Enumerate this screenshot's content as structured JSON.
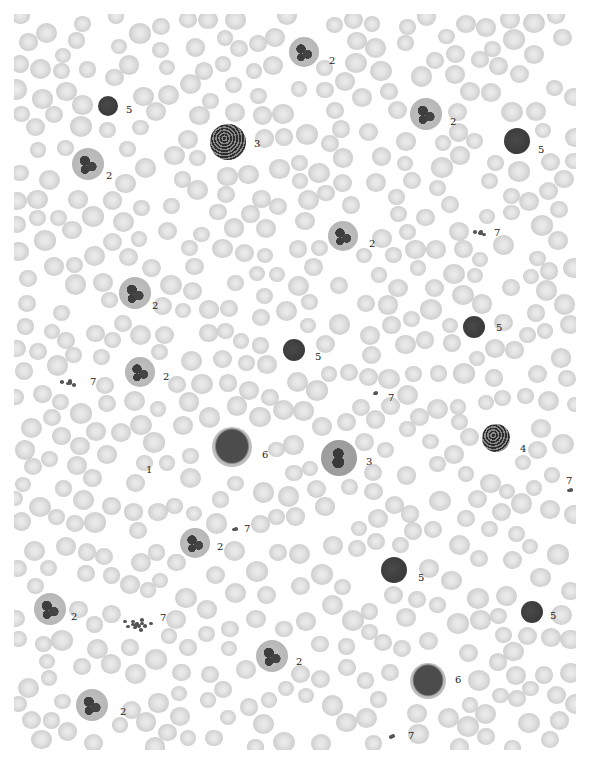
{
  "figure": {
    "background": "#ffffff",
    "rbc_color": "#d2d2d2"
  },
  "annotations": [
    {
      "label": "5",
      "x": 126,
      "y": 110,
      "cell": {
        "x": 108,
        "y": 106,
        "r": 10,
        "type": "lymphocyte"
      }
    },
    {
      "label": "3",
      "x": 254,
      "y": 144,
      "cell": {
        "x": 228,
        "y": 142,
        "r": 18,
        "type": "basophil-granular"
      }
    },
    {
      "label": "2",
      "x": 106,
      "y": 176,
      "cell": {
        "x": 88,
        "y": 164,
        "r": 16,
        "type": "neutrophil"
      }
    },
    {
      "label": "2",
      "x": 329,
      "y": 61,
      "cell": {
        "x": 304,
        "y": 52,
        "r": 15,
        "type": "neutrophil"
      }
    },
    {
      "label": "2",
      "x": 450,
      "y": 122,
      "cell": {
        "x": 426,
        "y": 114,
        "r": 16,
        "type": "neutrophil"
      }
    },
    {
      "label": "5",
      "x": 538,
      "y": 150,
      "cell": {
        "x": 517,
        "y": 141,
        "r": 13,
        "type": "lymphocyte"
      }
    },
    {
      "label": "2",
      "x": 369,
      "y": 244,
      "cell": {
        "x": 343,
        "y": 236,
        "r": 15,
        "type": "neutrophil"
      }
    },
    {
      "label": "7",
      "x": 494,
      "y": 233,
      "cell": {
        "x": 481,
        "y": 233,
        "r": 6,
        "type": "platelets"
      }
    },
    {
      "label": "2",
      "x": 152,
      "y": 306,
      "cell": {
        "x": 135,
        "y": 293,
        "r": 16,
        "type": "neutrophil"
      }
    },
    {
      "label": "5",
      "x": 496,
      "y": 328,
      "cell": {
        "x": 474,
        "y": 327,
        "r": 11,
        "type": "lymphocyte"
      }
    },
    {
      "label": "5",
      "x": 315,
      "y": 357,
      "cell": {
        "x": 294,
        "y": 350,
        "r": 11,
        "type": "lymphocyte"
      }
    },
    {
      "label": "2",
      "x": 163,
      "y": 377,
      "cell": {
        "x": 140,
        "y": 372,
        "r": 15,
        "type": "neutrophil"
      }
    },
    {
      "label": "7",
      "x": 90,
      "y": 382,
      "cell": {
        "x": 70,
        "y": 383,
        "r": 8,
        "type": "platelets"
      }
    },
    {
      "label": "7",
      "x": 388,
      "y": 398,
      "cell": {
        "x": 376,
        "y": 393,
        "r": 3,
        "type": "platelets"
      }
    },
    {
      "label": "6",
      "x": 262,
      "y": 455,
      "cell": {
        "x": 232,
        "y": 447,
        "r": 20,
        "type": "monocyte"
      }
    },
    {
      "label": "3",
      "x": 366,
      "y": 462,
      "cell": {
        "x": 339,
        "y": 458,
        "r": 18,
        "type": "eosinophil"
      }
    },
    {
      "label": "4",
      "x": 520,
      "y": 449,
      "cell": {
        "x": 496,
        "y": 438,
        "r": 14,
        "type": "basophil"
      }
    },
    {
      "label": "1",
      "x": 146,
      "y": 470,
      "cell": null
    },
    {
      "label": "7",
      "x": 566,
      "y": 481,
      "cell": {
        "x": 571,
        "y": 490,
        "r": 4,
        "type": "platelets"
      }
    },
    {
      "label": "7",
      "x": 244,
      "y": 529,
      "cell": {
        "x": 236,
        "y": 529,
        "r": 4,
        "type": "platelets"
      }
    },
    {
      "label": "2",
      "x": 217,
      "y": 547,
      "cell": {
        "x": 195,
        "y": 543,
        "r": 15,
        "type": "neutrophil"
      }
    },
    {
      "label": "5",
      "x": 418,
      "y": 578,
      "cell": {
        "x": 394,
        "y": 570,
        "r": 13,
        "type": "lymphocyte"
      }
    },
    {
      "label": "2",
      "x": 71,
      "y": 617,
      "cell": {
        "x": 50,
        "y": 609,
        "r": 16,
        "type": "neutrophil"
      }
    },
    {
      "label": "7",
      "x": 160,
      "y": 618,
      "cell": {
        "x": 137,
        "y": 625,
        "r": 12,
        "type": "platelets"
      }
    },
    {
      "label": "5",
      "x": 550,
      "y": 616,
      "cell": {
        "x": 532,
        "y": 612,
        "r": 11,
        "type": "lymphocyte"
      }
    },
    {
      "label": "2",
      "x": 296,
      "y": 662,
      "cell": {
        "x": 272,
        "y": 656,
        "r": 16,
        "type": "neutrophil"
      }
    },
    {
      "label": "6",
      "x": 455,
      "y": 680,
      "cell": {
        "x": 428,
        "y": 681,
        "r": 18,
        "type": "monocyte"
      }
    },
    {
      "label": "2",
      "x": 120,
      "y": 712,
      "cell": {
        "x": 92,
        "y": 705,
        "r": 16,
        "type": "neutrophil"
      }
    },
    {
      "label": "7",
      "x": 408,
      "y": 736,
      "cell": {
        "x": 393,
        "y": 736,
        "r": 5,
        "type": "platelets"
      }
    }
  ]
}
